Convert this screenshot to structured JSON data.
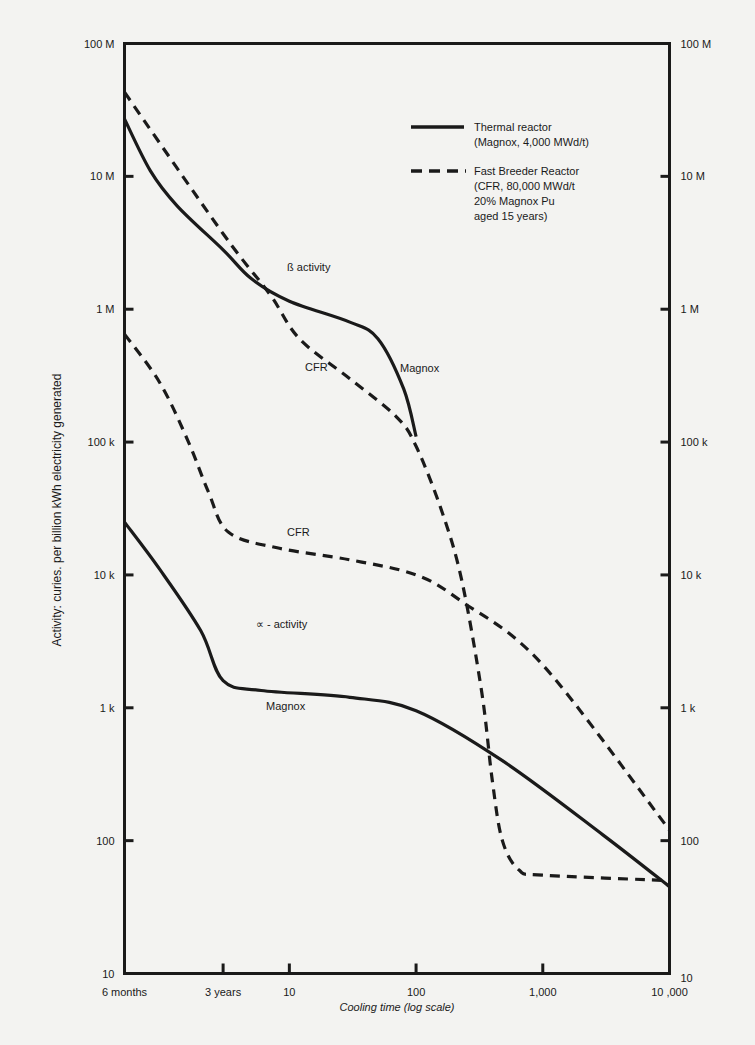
{
  "chart_data": {
    "type": "line",
    "title": "",
    "xlabel": "Cooling time (log scale)",
    "ylabel": "Activity: curies. per billion kWh electricity generated",
    "x_scale": "log",
    "y_scale": "log",
    "xlim": [
      0.5,
      10000
    ],
    "ylim": [
      10,
      100000000
    ],
    "grid": false,
    "legend_position": "top-right inside",
    "x_ticks": [
      {
        "value": 0.5,
        "label": "6 months"
      },
      {
        "value": 3,
        "label": "3 years"
      },
      {
        "value": 10,
        "label": "10"
      },
      {
        "value": 100,
        "label": "100"
      },
      {
        "value": 1000,
        "label": "1,000"
      },
      {
        "value": 10000,
        "label": "10 ,000"
      }
    ],
    "y_ticks_left": [
      {
        "value": 100000000,
        "label": "100 M"
      },
      {
        "value": 10000000,
        "label": "10 M"
      },
      {
        "value": 1000000,
        "label": "1 M"
      },
      {
        "value": 100000,
        "label": "100 k"
      },
      {
        "value": 10000,
        "label": "10 k"
      },
      {
        "value": 1000,
        "label": "1 k"
      },
      {
        "value": 100,
        "label": "100"
      },
      {
        "value": 10,
        "label": "10"
      }
    ],
    "y_ticks_right": [
      {
        "value": 100000000,
        "label": "100 M"
      },
      {
        "value": 10000000,
        "label": "10 M"
      },
      {
        "value": 1000000,
        "label": "1 M"
      },
      {
        "value": 100000,
        "label": "100 k"
      },
      {
        "value": 10000,
        "label": "10 k"
      },
      {
        "value": 1000,
        "label": "1 k"
      },
      {
        "value": 100,
        "label": "100"
      },
      {
        "value": 10,
        "label": "10"
      }
    ],
    "legend": [
      {
        "style": "solid",
        "lines": [
          "Thermal reactor",
          "(Magnox, 4,000 MWd/t)"
        ]
      },
      {
        "style": "dashed",
        "lines": [
          "Fast Breeder Reactor",
          "(CFR, 80,000 MWd/t",
          "20% Magnox Pu",
          "aged 15 years)"
        ]
      }
    ],
    "annotations": [
      {
        "text": "ß   activity",
        "x": 287,
        "y": 271
      },
      {
        "text": "CFR",
        "x": 305,
        "y": 371
      },
      {
        "text": "Magnox",
        "x": 400,
        "y": 372
      },
      {
        "text": "CFR",
        "x": 287,
        "y": 536
      },
      {
        "text": "∝  -  activity",
        "x": 256,
        "y": 628
      },
      {
        "text": "Magnox",
        "x": 266,
        "y": 710
      }
    ],
    "series": [
      {
        "name": "Magnox β activity",
        "style": "solid",
        "x": [
          0.5,
          0.8,
          1.3,
          3,
          5,
          10,
          30,
          50,
          80,
          100
        ],
        "y": [
          27000000,
          11000000,
          6000000,
          2800000,
          1700000,
          1150000,
          800000,
          600000,
          250000,
          110000
        ]
      },
      {
        "name": "CFR β activity",
        "style": "dashed",
        "x": [
          0.5,
          3,
          7,
          12,
          30,
          70,
          100,
          160,
          230,
          330,
          400,
          480,
          650,
          1000,
          10000
        ],
        "y": [
          43000000,
          3700000,
          1300000,
          600000,
          300000,
          155000,
          93000,
          30000,
          9000,
          1300,
          280,
          100,
          60,
          55,
          50
        ]
      },
      {
        "name": "CFR α activity",
        "style": "dashed",
        "x": [
          0.5,
          0.95,
          1.6,
          2.3,
          3.3,
          8,
          30,
          100,
          230,
          1000,
          10000
        ],
        "y": [
          650000,
          280000,
          100000,
          42000,
          21000,
          16000,
          13000,
          10000,
          6300,
          2100,
          120
        ]
      },
      {
        "name": "Magnox α activity",
        "style": "solid",
        "x": [
          0.5,
          0.95,
          2.0,
          3,
          6,
          30,
          100,
          480,
          3000,
          10000
        ],
        "y": [
          25000,
          11000,
          3800,
          1600,
          1350,
          1200,
          950,
          400,
          110,
          45
        ]
      }
    ]
  }
}
